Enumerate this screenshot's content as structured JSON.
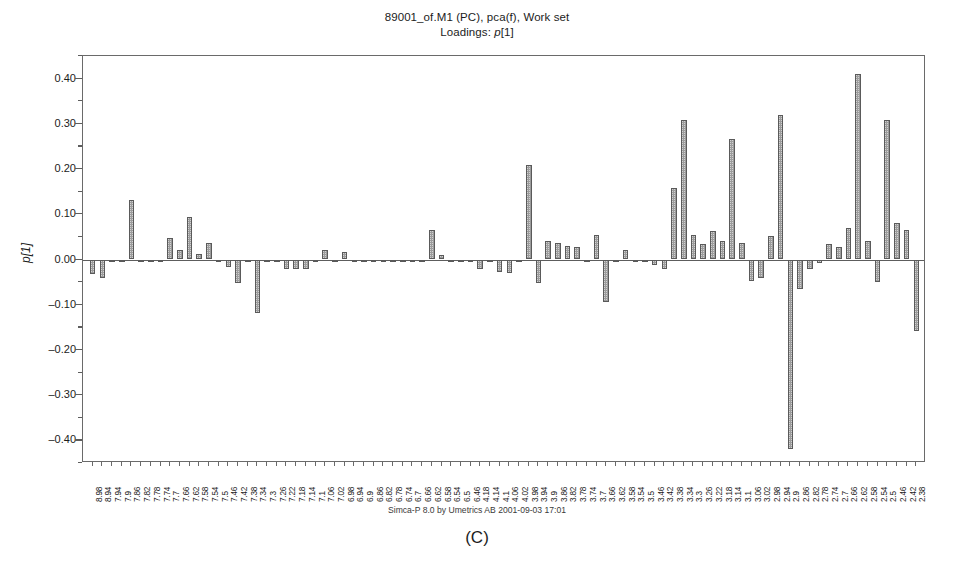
{
  "title": {
    "line1": "89001_of.M1 (PC), pca(f), Work set",
    "line2_prefix": "Loadings: ",
    "line2_var": "p",
    "line2_suffix": "[1]",
    "line2_full": "Loadings: p[1]"
  },
  "footer": {
    "credit": "Simca-P 8.0 by Umetrics AB 2001-09-03 17:01",
    "caption": "(C)"
  },
  "axes": {
    "y_title": "p[1]",
    "y_tick_labels": [
      "0.40",
      "0.30",
      "0.20",
      "0.10",
      "0.00",
      "-0.10",
      "-0.20",
      "-0.30",
      "-0.40"
    ],
    "y_min": -0.45,
    "y_max": 0.45,
    "y_major_step": 0.1,
    "y_minor_step": 0.05
  },
  "colors": {
    "bar_fill": "#9c9c9c",
    "bar_stroke": "#5a5a5a",
    "axis": "#6a6a6a",
    "text": "#1c1c1c",
    "background": "#ffffff"
  },
  "chart_data": {
    "type": "bar",
    "xlabel": "",
    "ylabel": "p[1]",
    "ylim": [
      -0.45,
      0.45
    ],
    "grid": false,
    "legend": false,
    "orientation": "vertical",
    "categories": [
      "8.98",
      "8.94",
      "7.94",
      "7.9",
      "7.86",
      "7.82",
      "7.78",
      "7.74",
      "7.7",
      "7.66",
      "7.62",
      "7.58",
      "7.54",
      "7.5",
      "7.46",
      "7.42",
      "7.38",
      "7.34",
      "7.3",
      "7.26",
      "7.22",
      "7.18",
      "7.14",
      "7.1",
      "7.06",
      "7.02",
      "6.98",
      "6.94",
      "6.9",
      "6.86",
      "6.82",
      "6.78",
      "6.74",
      "6.7",
      "6.66",
      "6.62",
      "6.58",
      "6.54",
      "6.5",
      "6.46",
      "4.18",
      "4.14",
      "4.1",
      "4.06",
      "4.02",
      "3.98",
      "3.94",
      "3.9",
      "3.86",
      "3.82",
      "3.78",
      "3.74",
      "3.7",
      "3.66",
      "3.62",
      "3.58",
      "3.54",
      "3.5",
      "3.46",
      "3.42",
      "3.38",
      "3.34",
      "3.3",
      "3.26",
      "3.22",
      "3.18",
      "3.14",
      "3.1",
      "3.06",
      "3.02",
      "2.98",
      "2.94",
      "2.9",
      "2.86",
      "2.82",
      "2.78",
      "2.74",
      "2.7",
      "2.66",
      "2.62",
      "2.58",
      "2.54",
      "2.5",
      "2.46",
      "2.42",
      "2.38"
    ],
    "values": [
      -0.032,
      -0.04,
      -0.006,
      -0.004,
      0.132,
      -0.003,
      -0.002,
      -0.002,
      0.047,
      0.022,
      0.093,
      0.012,
      0.036,
      -0.002,
      -0.016,
      -0.052,
      -0.003,
      -0.119,
      -0.004,
      -0.003,
      -0.022,
      -0.02,
      -0.02,
      -0.005,
      0.021,
      -0.004,
      0.017,
      -0.003,
      -0.003,
      -0.003,
      -0.004,
      -0.004,
      -0.004,
      -0.004,
      -0.005,
      0.066,
      0.011,
      -0.003,
      -0.004,
      -0.003,
      -0.02,
      -0.003,
      -0.028,
      -0.03,
      -0.004,
      0.209,
      -0.052,
      0.04,
      0.036,
      0.029,
      0.027,
      -0.004,
      0.055,
      -0.093,
      -0.004,
      0.02,
      -0.006,
      -0.004,
      -0.012,
      -0.022,
      0.158,
      0.308,
      0.055,
      0.035,
      0.062,
      0.041,
      0.266,
      0.037,
      -0.048,
      -0.042,
      0.053,
      0.32,
      -0.42,
      -0.066,
      -0.02,
      -0.008,
      0.035,
      0.027,
      0.07,
      0.41,
      0.04,
      -0.05,
      0.308,
      0.08,
      0.065,
      -0.158
    ]
  }
}
